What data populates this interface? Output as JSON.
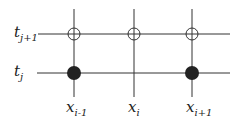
{
  "rows": [
    {
      "label": "t",
      "sub": "j+1",
      "y": 34,
      "x1": 38,
      "x2": 230
    },
    {
      "label": "t",
      "sub": "j",
      "y": 73,
      "x1": 37,
      "x2": 230
    }
  ],
  "columns": [
    {
      "label": "x",
      "sub": "i-1",
      "x": 74
    },
    {
      "label": "x",
      "sub": "i",
      "x": 134
    },
    {
      "label": "x",
      "sub": "i+1",
      "x": 192
    }
  ],
  "nodes": [
    {
      "col": "i-1",
      "row": "j+1",
      "type": "open"
    },
    {
      "col": "i",
      "row": "j+1",
      "type": "open"
    },
    {
      "col": "i+1",
      "row": "j+1",
      "type": "open"
    },
    {
      "col": "i-1",
      "row": "j",
      "type": "filled"
    },
    {
      "col": "i+1",
      "row": "j",
      "type": "filled"
    }
  ],
  "colors": {
    "line": "#333333",
    "filled": "#222222"
  }
}
